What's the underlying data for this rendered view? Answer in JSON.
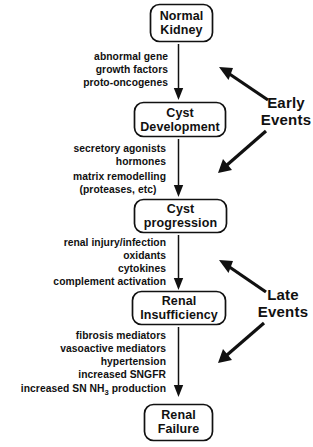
{
  "diagram": {
    "type": "flowchart",
    "background_color": "#ffffff",
    "line_color": "#111111",
    "stages": [
      {
        "id": "normal-kidney",
        "lines": [
          "Normal",
          "Kidney"
        ]
      },
      {
        "id": "cyst-development",
        "lines": [
          "Cyst",
          "Development"
        ]
      },
      {
        "id": "cyst-progression",
        "lines": [
          "Cyst",
          "progression"
        ]
      },
      {
        "id": "renal-insufficiency",
        "lines": [
          "Renal",
          "Insufficiency"
        ]
      },
      {
        "id": "renal-failure",
        "lines": [
          "Renal",
          "Failure"
        ]
      }
    ],
    "mediator_groups": [
      {
        "id": "mediators-cyst-development",
        "lines": [
          "abnormal  gene",
          "growth  factors",
          "proto-oncogenes"
        ]
      },
      {
        "id": "mediators-cyst-progression",
        "lines": [
          "secretory  agonists",
          "hormones",
          "matrix  remodelling",
          "(proteases,  etc)"
        ]
      },
      {
        "id": "mediators-renal-insufficiency",
        "lines": [
          "renal  injury/infection",
          "oxidants",
          "cytokines",
          "complement  activation"
        ]
      },
      {
        "id": "mediators-renal-failure",
        "lines": [
          "fibrosis  mediators",
          "vasoactive  mediators",
          "hypertension",
          "increased  SNGFR"
        ],
        "last_line": {
          "before": "increased  SN  NH",
          "subscript": "3",
          "after": "  production"
        }
      }
    ],
    "phase_labels": [
      {
        "id": "early-events",
        "lines": [
          "Early",
          "Events"
        ]
      },
      {
        "id": "late-events",
        "lines": [
          "Late",
          "Events"
        ]
      }
    ]
  }
}
